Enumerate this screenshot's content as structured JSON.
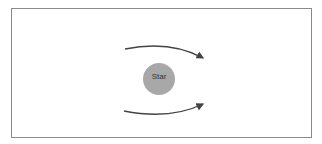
{
  "diagram": {
    "star": {
      "label": "Star",
      "fill": "#a8a8a8"
    },
    "arrows": [
      {
        "name": "upper-path-arrow",
        "direction": "left-to-right"
      },
      {
        "name": "lower-path-arrow",
        "direction": "left-to-right"
      }
    ],
    "colors": {
      "border": "#8a8a8a",
      "arrow": "#444444"
    }
  }
}
